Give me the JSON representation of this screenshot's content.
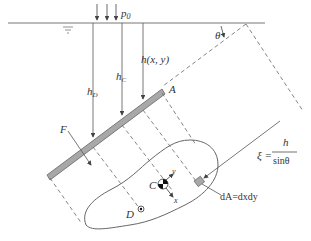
{
  "diagram": {
    "labels": {
      "p0": "p",
      "p0_sub": "0",
      "theta": "θ",
      "h_xy": "h(x, y)",
      "h_C": "h",
      "h_C_sub": "C",
      "h_D": "h",
      "h_D_sub": "D",
      "F": "F",
      "A": "A",
      "C": "C",
      "D": "D",
      "x_axis": "x",
      "y_axis": "y",
      "dA": "dA=dxdy",
      "xi_lhs": "ξ =",
      "xi_num": "h",
      "xi_den": "sinθ"
    },
    "colors": {
      "line": "#555555",
      "plate_fill": "#a8a8a8",
      "plate_edge": "#666666",
      "text": "#333333"
    }
  }
}
